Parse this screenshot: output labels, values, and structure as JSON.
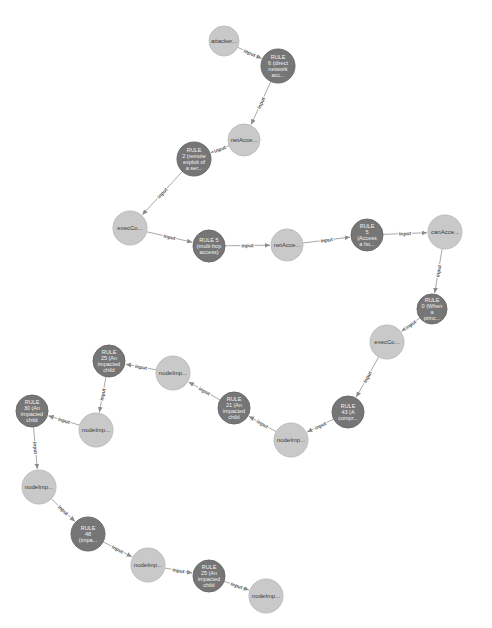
{
  "graph": {
    "edge_label": "input",
    "colors": {
      "rule_node": "#767676",
      "fact_node": "#c9c9c9",
      "edge": "#a9a9a9",
      "background": "#ffffff"
    },
    "nodes": [
      {
        "id": "n1",
        "type": "fact",
        "x": 224,
        "y": 41,
        "r": 15,
        "lines": [
          "attacker..."
        ]
      },
      {
        "id": "n2",
        "type": "rule",
        "x": 278,
        "y": 66,
        "r": 17,
        "lines": [
          "RULE",
          "6 (direct",
          "network",
          "acc..."
        ]
      },
      {
        "id": "n3",
        "type": "fact",
        "x": 244,
        "y": 140,
        "r": 16,
        "lines": [
          "netAcce..."
        ]
      },
      {
        "id": "n4",
        "type": "rule",
        "x": 194,
        "y": 159,
        "r": 17,
        "lines": [
          "RULE",
          "2 (remote",
          "exploit of",
          "a ser..."
        ]
      },
      {
        "id": "n5",
        "type": "fact",
        "x": 130,
        "y": 228,
        "r": 17,
        "lines": [
          "execCo..."
        ]
      },
      {
        "id": "n6",
        "type": "rule",
        "x": 209,
        "y": 246,
        "r": 16,
        "lines": [
          "RULE 5",
          "(multi-hop",
          "access)"
        ]
      },
      {
        "id": "n7",
        "type": "fact",
        "x": 287,
        "y": 245,
        "r": 16,
        "lines": [
          "netAcce..."
        ]
      },
      {
        "id": "n8",
        "type": "rule",
        "x": 367,
        "y": 235,
        "r": 16,
        "lines": [
          "RULE",
          "5",
          "(Access",
          "a ho..."
        ]
      },
      {
        "id": "n9",
        "type": "fact",
        "x": 445,
        "y": 232,
        "r": 17,
        "lines": [
          "canAcce..."
        ]
      },
      {
        "id": "n10",
        "type": "rule",
        "x": 432,
        "y": 309,
        "r": 15,
        "lines": [
          "RULE",
          "0 (When",
          "a",
          "princ..."
        ]
      },
      {
        "id": "n11",
        "type": "fact",
        "x": 387,
        "y": 342,
        "r": 17,
        "lines": [
          "execCo..."
        ]
      },
      {
        "id": "n12",
        "type": "rule",
        "x": 348,
        "y": 412,
        "r": 16,
        "lines": [
          "RULE",
          "43 (A",
          "compr..."
        ]
      },
      {
        "id": "n13",
        "type": "fact",
        "x": 291,
        "y": 440,
        "r": 17,
        "lines": [
          "nodeImp..."
        ]
      },
      {
        "id": "n14",
        "type": "rule",
        "x": 234,
        "y": 408,
        "r": 16,
        "lines": [
          "RULE",
          "21 (An",
          "impacted",
          "child"
        ]
      },
      {
        "id": "n15",
        "type": "fact",
        "x": 173,
        "y": 373,
        "r": 17,
        "lines": [
          "nodeImp..."
        ]
      },
      {
        "id": "n16",
        "type": "rule",
        "x": 109,
        "y": 361,
        "r": 16,
        "lines": [
          "RULE",
          "25 (An",
          "impacted",
          "child"
        ]
      },
      {
        "id": "n17",
        "type": "fact",
        "x": 96,
        "y": 430,
        "r": 17,
        "lines": [
          "nodeImp..."
        ]
      },
      {
        "id": "n18",
        "type": "rule",
        "x": 32,
        "y": 411,
        "r": 16,
        "lines": [
          "RULE",
          "30 (An",
          "impacted",
          "child"
        ]
      },
      {
        "id": "n19",
        "type": "fact",
        "x": 39,
        "y": 487,
        "r": 17,
        "lines": [
          "nodeImp..."
        ]
      },
      {
        "id": "n20",
        "type": "rule",
        "x": 88,
        "y": 534,
        "r": 17,
        "lines": [
          "RULE",
          "48",
          "(impa..."
        ]
      },
      {
        "id": "n21",
        "type": "fact",
        "x": 148,
        "y": 565,
        "r": 17,
        "lines": [
          "nodeImp..."
        ]
      },
      {
        "id": "n22",
        "type": "rule",
        "x": 209,
        "y": 576,
        "r": 16,
        "lines": [
          "RULE",
          "25 (An",
          "impacted",
          "child"
        ]
      },
      {
        "id": "n23",
        "type": "fact",
        "x": 266,
        "y": 596,
        "r": 17,
        "lines": [
          "nodeImp..."
        ]
      }
    ],
    "edges": [
      {
        "from": "n1",
        "to": "n2",
        "label": "input"
      },
      {
        "from": "n2",
        "to": "n3",
        "label": "input"
      },
      {
        "from": "n3",
        "to": "n4",
        "label": "input"
      },
      {
        "from": "n4",
        "to": "n5",
        "label": "input"
      },
      {
        "from": "n5",
        "to": "n6",
        "label": "input"
      },
      {
        "from": "n6",
        "to": "n7",
        "label": "input"
      },
      {
        "from": "n7",
        "to": "n8",
        "label": "input"
      },
      {
        "from": "n8",
        "to": "n9",
        "label": "input"
      },
      {
        "from": "n9",
        "to": "n10",
        "label": "input"
      },
      {
        "from": "n10",
        "to": "n11",
        "label": "input"
      },
      {
        "from": "n11",
        "to": "n12",
        "label": "input"
      },
      {
        "from": "n12",
        "to": "n13",
        "label": "input"
      },
      {
        "from": "n13",
        "to": "n14",
        "label": "input"
      },
      {
        "from": "n14",
        "to": "n15",
        "label": "input"
      },
      {
        "from": "n15",
        "to": "n16",
        "label": "input"
      },
      {
        "from": "n16",
        "to": "n17",
        "label": "input"
      },
      {
        "from": "n17",
        "to": "n18",
        "label": "input"
      },
      {
        "from": "n18",
        "to": "n19",
        "label": "input"
      },
      {
        "from": "n19",
        "to": "n20",
        "label": "input"
      },
      {
        "from": "n20",
        "to": "n21",
        "label": "input"
      },
      {
        "from": "n21",
        "to": "n22",
        "label": "input"
      },
      {
        "from": "n22",
        "to": "n23",
        "label": "input"
      }
    ]
  }
}
